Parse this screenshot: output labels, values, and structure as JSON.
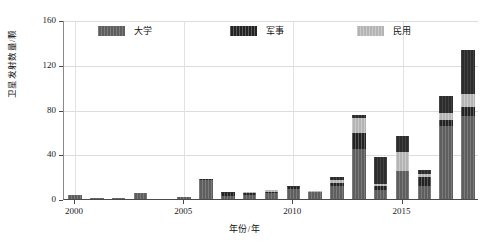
{
  "chart_data": {
    "type": "bar",
    "subtype": "stacked-vertical",
    "title": "",
    "xlabel": "年份/年",
    "ylabel": "卫星发射数量/颗",
    "categories": [
      "2000",
      "2001",
      "2002",
      "2003",
      "2004",
      "2005",
      "2006",
      "2007",
      "2008",
      "2009",
      "2010",
      "2011",
      "2012",
      "2013",
      "2014",
      "2015",
      "2016",
      "2017",
      "2018"
    ],
    "x_tick_labels": [
      "2000",
      "2005",
      "2010",
      "2015"
    ],
    "y_tick_labels": [
      "0",
      "40",
      "80",
      "120",
      "160"
    ],
    "ylim": [
      0,
      160
    ],
    "yticks": [
      0,
      40,
      80,
      120,
      160
    ],
    "grid": true,
    "legend_position": "top-inside",
    "series": [
      {
        "name": "大学",
        "color": "#5e5e5e",
        "values": [
          4,
          1,
          1,
          5,
          0,
          2,
          17,
          3,
          4,
          5,
          9,
          6,
          12,
          45,
          8,
          25,
          12,
          65,
          74
        ]
      },
      {
        "name": "军事",
        "color": "#232323",
        "values": [
          0,
          0,
          0,
          0,
          0,
          0,
          1,
          2,
          1,
          1,
          2,
          0,
          2,
          14,
          4,
          0,
          8,
          6,
          8
        ]
      },
      {
        "name": "民用",
        "color": "#b4b4b4",
        "values": [
          0,
          0,
          0,
          0,
          0,
          0,
          0,
          0,
          1,
          2,
          0,
          1,
          3,
          13,
          1,
          17,
          2,
          6,
          12
        ]
      },
      {
        "name": "商用",
        "color": "#2c2c2c",
        "values": [
          0,
          0,
          0,
          0,
          0,
          0,
          0,
          1,
          0,
          0,
          1,
          0,
          3,
          3,
          25,
          14,
          4,
          15,
          39
        ]
      }
    ],
    "totals": [
      4,
      1,
      1,
      5,
      0,
      2,
      18,
      6,
      6,
      8,
      12,
      7,
      20,
      75,
      38,
      56,
      26,
      92,
      133
    ]
  },
  "legend": {
    "items": [
      {
        "label": "大学",
        "swatch": "univ"
      },
      {
        "label": "军事",
        "swatch": "mil"
      },
      {
        "label": "民用",
        "swatch": "civ"
      },
      {
        "label": "商用",
        "swatch": "com"
      }
    ]
  }
}
